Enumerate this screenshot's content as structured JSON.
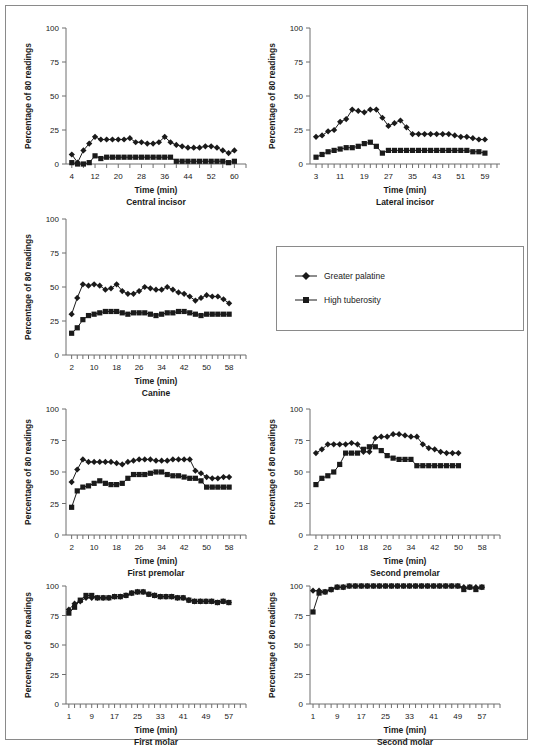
{
  "figure": {
    "ylabel": "Percentage of 80 readings",
    "xlabel": "Time (min)",
    "yticks": [
      0,
      25,
      50,
      75,
      100
    ]
  },
  "legend": {
    "position": "middle-right",
    "items": [
      {
        "label": "Greater palatine",
        "marker": "diamond",
        "color": "#1a1a1a"
      },
      {
        "label": "High tuberosity",
        "marker": "square",
        "color": "#1a1a1a"
      }
    ]
  },
  "chart_data": [
    {
      "type": "line",
      "title": "Central incisor",
      "xlabel": "Time (min)",
      "ylabel": "Percentage of 80 readings",
      "ylim": [
        0,
        100
      ],
      "xlim": [
        2,
        64
      ],
      "xticklabels": [
        4,
        12,
        20,
        28,
        36,
        44,
        52,
        60
      ],
      "xtickstep": 4,
      "grid": false,
      "x": [
        4,
        6,
        8,
        10,
        12,
        14,
        16,
        18,
        20,
        22,
        24,
        26,
        28,
        30,
        32,
        34,
        36,
        38,
        40,
        42,
        44,
        46,
        48,
        50,
        52,
        54,
        56,
        58,
        60
      ],
      "series": [
        {
          "name": "Greater palatine",
          "marker": "diamond",
          "values": [
            7,
            1,
            10,
            15,
            20,
            18,
            18,
            18,
            18,
            18,
            19,
            16,
            16,
            15,
            15,
            16,
            20,
            16,
            14,
            13,
            12,
            12,
            12,
            13,
            13,
            12,
            10,
            8,
            10
          ]
        },
        {
          "name": "High tuberosity",
          "marker": "square",
          "values": [
            1,
            0,
            0,
            1,
            6,
            4,
            5,
            5,
            5,
            5,
            5,
            5,
            5,
            5,
            5,
            5,
            5,
            5,
            2,
            2,
            2,
            2,
            2,
            2,
            2,
            2,
            2,
            1,
            2
          ]
        }
      ]
    },
    {
      "type": "line",
      "title": "Lateral incisor",
      "xlabel": "Time (min)",
      "ylabel": "Percentage of 80 readings",
      "ylim": [
        0,
        100
      ],
      "xlim": [
        1,
        64
      ],
      "xticklabels": [
        3,
        11,
        19,
        27,
        35,
        43,
        51,
        59
      ],
      "xtickstep": 2,
      "grid": false,
      "x": [
        3,
        5,
        7,
        9,
        11,
        13,
        15,
        17,
        19,
        21,
        23,
        25,
        27,
        29,
        31,
        33,
        35,
        37,
        39,
        41,
        43,
        45,
        47,
        49,
        51,
        53,
        55,
        57,
        59
      ],
      "series": [
        {
          "name": "Greater palatine",
          "marker": "diamond",
          "values": [
            20,
            21,
            24,
            25,
            31,
            33,
            40,
            39,
            38,
            40,
            40,
            34,
            28,
            30,
            32,
            27,
            22,
            22,
            22,
            22,
            22,
            22,
            22,
            21,
            20,
            20,
            19,
            18,
            18
          ]
        },
        {
          "name": "High tuberosity",
          "marker": "square",
          "values": [
            5,
            7,
            9,
            10,
            11,
            12,
            12,
            13,
            15,
            16,
            13,
            8,
            10,
            10,
            10,
            10,
            10,
            10,
            10,
            10,
            10,
            10,
            10,
            10,
            10,
            10,
            9,
            9,
            8
          ]
        }
      ]
    },
    {
      "type": "line",
      "title": "Canine",
      "xlabel": "Time (min)",
      "ylabel": "Percentage of 80 readings",
      "ylim": [
        0,
        100
      ],
      "xlim": [
        0,
        64
      ],
      "xticklabels": [
        2,
        10,
        18,
        26,
        34,
        42,
        50,
        58
      ],
      "xtickstep": 2,
      "grid": false,
      "x": [
        2,
        4,
        6,
        8,
        10,
        12,
        14,
        16,
        18,
        20,
        22,
        24,
        26,
        28,
        30,
        32,
        34,
        36,
        38,
        40,
        42,
        44,
        46,
        48,
        50,
        52,
        54,
        56,
        58
      ],
      "series": [
        {
          "name": "Greater palatine",
          "marker": "diamond",
          "values": [
            30,
            42,
            52,
            51,
            52,
            51,
            48,
            49,
            52,
            47,
            45,
            45,
            47,
            50,
            49,
            48,
            48,
            50,
            48,
            46,
            45,
            43,
            40,
            42,
            44,
            43,
            43,
            41,
            38
          ]
        },
        {
          "name": "High tuberosity",
          "marker": "square",
          "values": [
            16,
            20,
            26,
            29,
            30,
            31,
            32,
            32,
            32,
            31,
            30,
            31,
            31,
            31,
            30,
            29,
            30,
            31,
            31,
            32,
            32,
            31,
            30,
            29,
            30,
            30,
            30,
            30,
            30
          ]
        }
      ]
    },
    {
      "type": "line",
      "title": "First premolar",
      "xlabel": "Time (min)",
      "ylabel": "Percentage of 80 readings",
      "ylim": [
        0,
        100
      ],
      "xlim": [
        0,
        64
      ],
      "xticklabels": [
        2,
        10,
        18,
        26,
        34,
        42,
        50,
        58
      ],
      "xtickstep": 2,
      "grid": false,
      "x": [
        2,
        4,
        6,
        8,
        10,
        12,
        14,
        16,
        18,
        20,
        22,
        24,
        26,
        28,
        30,
        32,
        34,
        36,
        38,
        40,
        42,
        44,
        46,
        48,
        50,
        52,
        54,
        56,
        58
      ],
      "series": [
        {
          "name": "Greater palatine",
          "marker": "diamond",
          "values": [
            42,
            52,
            60,
            58,
            58,
            58,
            58,
            58,
            57,
            56,
            58,
            59,
            60,
            60,
            60,
            59,
            59,
            59,
            60,
            60,
            60,
            60,
            51,
            49,
            46,
            45,
            45,
            46,
            46
          ]
        },
        {
          "name": "High tuberosity",
          "marker": "square",
          "values": [
            22,
            35,
            38,
            39,
            41,
            43,
            41,
            40,
            40,
            41,
            45,
            48,
            48,
            48,
            49,
            50,
            50,
            48,
            47,
            47,
            46,
            45,
            45,
            43,
            38,
            38,
            38,
            38,
            38
          ]
        }
      ]
    },
    {
      "type": "line",
      "title": "Second premolar",
      "xlabel": "Time (min)",
      "ylabel": "Percentage of 80 readings",
      "ylim": [
        0,
        100
      ],
      "xlim": [
        0,
        64
      ],
      "xticklabels": [
        2,
        10,
        18,
        26,
        34,
        42,
        50,
        58
      ],
      "xtickstep": 2,
      "grid": false,
      "x": [
        2,
        4,
        6,
        8,
        10,
        12,
        14,
        16,
        18,
        20,
        22,
        24,
        26,
        28,
        30,
        32,
        34,
        36,
        38,
        40,
        42,
        44,
        46,
        48,
        50
      ],
      "series": [
        {
          "name": "Greater palatine",
          "marker": "diamond",
          "values": [
            65,
            68,
            72,
            72,
            72,
            72,
            73,
            72,
            66,
            66,
            77,
            78,
            78,
            80,
            80,
            79,
            78,
            78,
            72,
            69,
            68,
            66,
            65,
            65,
            65
          ]
        },
        {
          "name": "High tuberosity",
          "marker": "square",
          "values": [
            40,
            45,
            47,
            50,
            56,
            65,
            65,
            65,
            68,
            70,
            70,
            67,
            63,
            61,
            60,
            60,
            60,
            55,
            55,
            55,
            55,
            55,
            55,
            55,
            55
          ]
        }
      ]
    },
    {
      "type": "line",
      "title": "First molar",
      "xlabel": "Time (min)",
      "ylabel": "Percentage of 80 readings",
      "ylim": [
        0,
        100
      ],
      "xlim": [
        0,
        63
      ],
      "xticklabels": [
        1,
        9,
        17,
        25,
        33,
        41,
        49,
        57
      ],
      "xtickstep": 2,
      "grid": false,
      "x": [
        1,
        3,
        5,
        7,
        9,
        11,
        13,
        15,
        17,
        19,
        21,
        23,
        25,
        27,
        29,
        31,
        33,
        35,
        37,
        39,
        41,
        43,
        45,
        47,
        49,
        51,
        53,
        55,
        57
      ],
      "series": [
        {
          "name": "Greater palatine",
          "marker": "diamond",
          "values": [
            80,
            85,
            87,
            90,
            90,
            90,
            90,
            90,
            91,
            91,
            92,
            94,
            95,
            95,
            93,
            92,
            91,
            91,
            91,
            90,
            90,
            88,
            87,
            87,
            87,
            87,
            86,
            87,
            86
          ]
        },
        {
          "name": "High tuberosity",
          "marker": "square",
          "values": [
            77,
            82,
            88,
            92,
            92,
            90,
            90,
            90,
            91,
            91,
            92,
            94,
            95,
            95,
            93,
            92,
            91,
            91,
            91,
            90,
            90,
            88,
            87,
            87,
            87,
            87,
            86,
            87,
            86
          ]
        }
      ]
    },
    {
      "type": "line",
      "title": "Second molar",
      "xlabel": "Time (min)",
      "ylabel": "Percentage of 80 readings",
      "ylim": [
        0,
        100
      ],
      "xlim": [
        0,
        63
      ],
      "xticklabels": [
        1,
        9,
        17,
        25,
        33,
        41,
        49,
        57
      ],
      "xtickstep": 2,
      "grid": false,
      "x": [
        1,
        3,
        5,
        7,
        9,
        11,
        13,
        15,
        17,
        19,
        21,
        23,
        25,
        27,
        29,
        31,
        33,
        35,
        37,
        39,
        41,
        43,
        45,
        47,
        49,
        51,
        53,
        55,
        57
      ],
      "series": [
        {
          "name": "Greater palatine",
          "marker": "diamond",
          "values": [
            96,
            96,
            95,
            97,
            99,
            99,
            100,
            100,
            100,
            100,
            100,
            100,
            100,
            100,
            100,
            100,
            100,
            100,
            100,
            100,
            100,
            100,
            100,
            100,
            100,
            99,
            99,
            99,
            99
          ]
        },
        {
          "name": "High tuberosity",
          "marker": "square",
          "values": [
            78,
            94,
            95,
            97,
            99,
            99,
            100,
            100,
            100,
            100,
            100,
            100,
            100,
            100,
            100,
            100,
            100,
            100,
            100,
            100,
            100,
            100,
            100,
            100,
            100,
            97,
            99,
            97,
            99
          ]
        }
      ]
    }
  ],
  "panel_layout": [
    {
      "key": "central-incisor",
      "left": 14,
      "top": 12,
      "w": 240,
      "h": 190
    },
    {
      "key": "lateral-incisor",
      "left": 258,
      "top": 12,
      "w": 250,
      "h": 190
    },
    {
      "key": "canine",
      "left": 14,
      "top": 203,
      "w": 240,
      "h": 190
    },
    {
      "key": "first-premolar",
      "left": 14,
      "top": 393,
      "w": 240,
      "h": 180
    },
    {
      "key": "second-premolar",
      "left": 258,
      "top": 393,
      "w": 250,
      "h": 180
    },
    {
      "key": "first-molar",
      "left": 14,
      "top": 570,
      "w": 240,
      "h": 172
    },
    {
      "key": "second-molar",
      "left": 258,
      "top": 570,
      "w": 250,
      "h": 172
    }
  ]
}
